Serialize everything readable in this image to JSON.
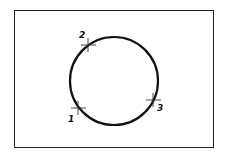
{
  "diagram": {
    "type": "three-point circle construction",
    "circle": {
      "cx": 114,
      "cy": 81,
      "r": 44,
      "stroke": "#111111"
    },
    "frame": {
      "stroke": "#222222"
    },
    "points": [
      {
        "label": "1",
        "x": 78,
        "y": 108,
        "lx": 70,
        "ly": 121
      },
      {
        "label": "2",
        "x": 88,
        "y": 45,
        "lx": 80,
        "ly": 38
      },
      {
        "label": "3",
        "x": 153,
        "y": 100,
        "lx": 158,
        "ly": 110
      }
    ]
  }
}
